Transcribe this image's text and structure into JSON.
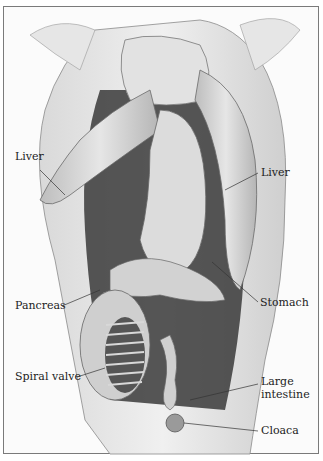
{
  "figure": {
    "labels": [
      {
        "id": "liver-left",
        "text": "Liver",
        "x": 15,
        "y": 157
      },
      {
        "id": "liver-right",
        "text": "Liver",
        "x": 261,
        "y": 168
      },
      {
        "id": "pancreas",
        "text": "Pancreas",
        "x": 15,
        "y": 301
      },
      {
        "id": "stomach",
        "text": "Stomach",
        "x": 260,
        "y": 298
      },
      {
        "id": "spiral-valve",
        "text": "Spiral valve",
        "x": 15,
        "y": 372
      },
      {
        "id": "large-intestine-1",
        "text": "Large",
        "x": 261,
        "y": 377
      },
      {
        "id": "large-intestine-2",
        "text": "intestine",
        "x": 261,
        "y": 390
      },
      {
        "id": "cloaca",
        "text": "Cloaca",
        "x": 261,
        "y": 426
      }
    ]
  }
}
